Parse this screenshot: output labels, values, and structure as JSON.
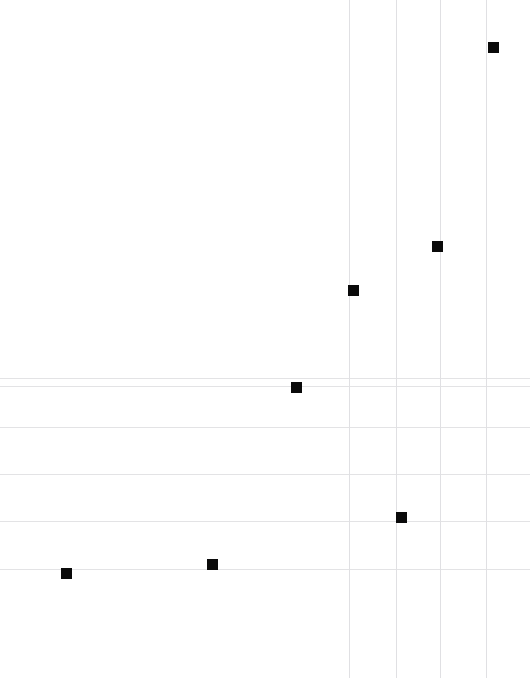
{
  "chart_data": {
    "type": "scatter",
    "title": "",
    "subtitle": "",
    "xlabel": "",
    "ylabel": "",
    "xlim": [
      0,
      530
    ],
    "ylim": [
      0,
      678
    ],
    "grid": true,
    "legend": null,
    "marker": {
      "shape": "square",
      "size_px": 11,
      "color": "#0a0a0a"
    },
    "axis_direction": "screen-pixels-origin-top-left",
    "points": [
      {
        "label": "p1",
        "x": 66.5,
        "y": 573.5
      },
      {
        "label": "p2",
        "x": 212.5,
        "y": 564.0
      },
      {
        "label": "p3",
        "x": 296.5,
        "y": 387.0
      },
      {
        "label": "p4",
        "x": 353.0,
        "y": 290.5
      },
      {
        "label": "p5",
        "x": 401.5,
        "y": 517.5
      },
      {
        "label": "p6",
        "x": 437.5,
        "y": 246.0
      },
      {
        "label": "p7",
        "x": 493.0,
        "y": 47.5
      }
    ],
    "series": [
      {
        "name": "series-1",
        "x": [
          66.5,
          212.5,
          296.5,
          353.0,
          401.5,
          437.5,
          493.0
        ],
        "values": [
          573.5,
          564.0,
          387.0,
          290.5,
          517.5,
          246.0,
          47.5
        ]
      }
    ],
    "gridlines": {
      "horizontal_y": [
        378,
        386,
        427,
        474,
        521,
        569
      ],
      "vertical_x": [
        349,
        396,
        440,
        486
      ],
      "horizontal_color": "#e3e3e5",
      "vertical_color": "#e0e0e3"
    },
    "tick_labels": {
      "x": [],
      "y": []
    },
    "annotations": [],
    "background_color": "#ffffff"
  },
  "canvas": {
    "width": 530,
    "height": 678
  }
}
